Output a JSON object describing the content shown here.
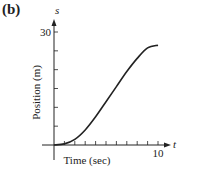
{
  "panel_label": "(b)",
  "chart_data": {
    "type": "line",
    "title": "",
    "xlabel": "Time (sec)",
    "ylabel": "Position (m)",
    "x_var": "t",
    "y_var": "s",
    "xlim": [
      0,
      10
    ],
    "ylim": [
      0,
      30
    ],
    "x_tick_labels": [
      "10"
    ],
    "y_tick_labels": [
      "30"
    ],
    "x_ticks": [
      1,
      2,
      3,
      4,
      5,
      6,
      7,
      8,
      9,
      10
    ],
    "y_ticks": [
      5,
      10,
      15,
      20,
      25,
      30
    ],
    "grid": false,
    "legend": null,
    "series": [
      {
        "name": "s(t)",
        "x": [
          0,
          1,
          2,
          3,
          4,
          5,
          6,
          7,
          8,
          9,
          10
        ],
        "y": [
          0,
          0.3,
          1.5,
          4,
          7.5,
          11.5,
          15.5,
          19.5,
          23,
          25.8,
          26.5
        ]
      }
    ]
  }
}
